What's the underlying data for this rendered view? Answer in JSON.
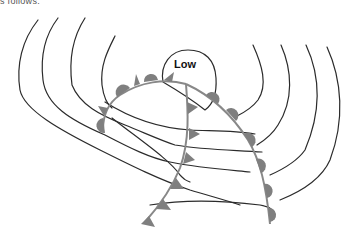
{
  "caption_fragment": "s follows:",
  "diagram": {
    "type": "weather-map",
    "pressure_center": {
      "label": "Low"
    },
    "fronts": [
      {
        "name": "warm-front",
        "symbol": "semicircles"
      },
      {
        "name": "cold-front",
        "symbol": "triangles"
      },
      {
        "name": "occluded-front",
        "symbol": "alternating-triangles-semicircles"
      }
    ],
    "isobar_count": 10,
    "colors": {
      "isobar": "#2b2b2b",
      "front_symbol": "#7f7f7f",
      "background": "#ffffff"
    }
  }
}
